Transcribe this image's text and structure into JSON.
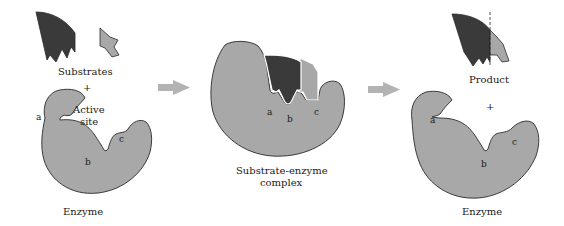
{
  "figure": {
    "panels": [
      {
        "id": "reactants",
        "labels": {
          "substrates": "Substrates",
          "plus": "+",
          "active_site_line1": "Active",
          "active_site_line2": "site",
          "enzyme": "Enzyme",
          "site_a": "a",
          "site_b": "b",
          "site_c": "c"
        }
      },
      {
        "id": "complex",
        "labels": {
          "complex_line1": "Substrate-enzyme",
          "complex_line2": "complex",
          "site_a": "a",
          "site_b": "b",
          "site_c": "c"
        }
      },
      {
        "id": "products",
        "labels": {
          "product": "Product",
          "plus": "+",
          "enzyme": "Enzyme",
          "site_a": "a",
          "site_b": "b",
          "site_c": "c"
        }
      }
    ],
    "arrows": [
      {
        "id": "arrow-1",
        "direction": "right"
      },
      {
        "id": "arrow-2",
        "direction": "right"
      }
    ],
    "colors": {
      "enzyme_fill": "#a8a8a8",
      "dark_substrate": "#3a3a3a",
      "light_substrate": "#a8a8a8",
      "arrow": "#b3b3b3",
      "outline": "#2a2a2a",
      "background": "#ffffff"
    }
  }
}
